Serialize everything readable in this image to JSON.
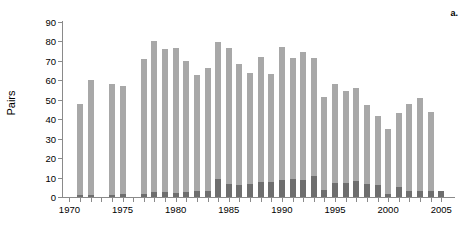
{
  "panel": {
    "label": "a."
  },
  "axes": {
    "ylabel": "Pairs",
    "xlabel": "",
    "ytick_labels": [
      "0",
      "10",
      "20",
      "30",
      "40",
      "50",
      "60",
      "70",
      "80",
      "90"
    ],
    "xtick_labels": [
      "1970",
      "1975",
      "1980",
      "1985",
      "1990",
      "1995",
      "2000",
      "2005"
    ]
  },
  "colors": {
    "series_light": "#a8a8a8",
    "series_dark": "#6e6e6e",
    "axis": "#8a8a8a",
    "text": "#000000",
    "background": "#ffffff"
  },
  "chart_data": {
    "type": "bar",
    "title": "",
    "xlabel": "",
    "ylabel": "Pairs",
    "xlim": [
      1969.3,
      2006.2
    ],
    "ylim": [
      0,
      90
    ],
    "ytick_values": [
      0,
      10,
      20,
      30,
      40,
      50,
      60,
      70,
      80,
      90
    ],
    "xtick_values": [
      1970,
      1975,
      1980,
      1985,
      1990,
      1995,
      2000,
      2005
    ],
    "grid": false,
    "legend": "none",
    "bar_mode": "overlay",
    "categories": [
      1970,
      1971,
      1972,
      1973,
      1974,
      1975,
      1976,
      1977,
      1978,
      1979,
      1980,
      1981,
      1982,
      1983,
      1984,
      1985,
      1986,
      1987,
      1988,
      1989,
      1990,
      1991,
      1992,
      1993,
      1994,
      1995,
      1996,
      1997,
      1998,
      1999,
      2000,
      2001,
      2002,
      2003,
      2004,
      2005
    ],
    "series": [
      {
        "name": "total-pairs",
        "color": "#a8a8a8",
        "values": [
          0,
          48,
          60,
          0,
          58,
          57,
          0,
          71,
          80,
          76,
          76.5,
          70,
          62.5,
          66.5,
          79.5,
          76.5,
          68.5,
          64,
          72,
          63.5,
          77,
          71.5,
          74.5,
          71.5,
          51.5,
          58,
          54.5,
          56,
          47.5,
          41.5,
          35,
          43,
          48,
          51,
          43.5,
          0
        ]
      },
      {
        "name": "breeding-pairs",
        "color": "#6e6e6e",
        "values": [
          0,
          0.8,
          0.8,
          0,
          1.2,
          1.5,
          0,
          1.5,
          2.5,
          2.5,
          2.0,
          2.5,
          3.0,
          3.0,
          9.5,
          6.5,
          6.0,
          6.5,
          7.5,
          7.5,
          9.0,
          9.5,
          9.0,
          11.0,
          3.5,
          7.0,
          7.0,
          8.0,
          6.5,
          6.0,
          1.5,
          5.0,
          3.0,
          3.0,
          3.0,
          3.0
        ]
      }
    ]
  }
}
